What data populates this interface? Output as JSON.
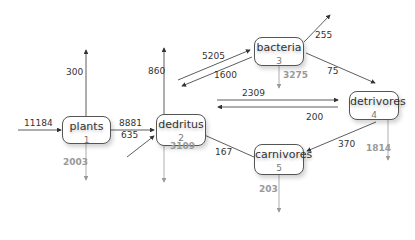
{
  "colors": {
    "flow_arrow": "#333333",
    "loss_arrow": "#999999",
    "node_border": "#555555"
  },
  "nodes": [
    {
      "id": "plants",
      "name": "plants",
      "number": "1"
    },
    {
      "id": "dedritus",
      "name": "dedritus",
      "number": "2"
    },
    {
      "id": "bacteria",
      "name": "bacteria",
      "number": "3"
    },
    {
      "id": "detrivores",
      "name": "detrivores",
      "number": "4"
    },
    {
      "id": "carnivores",
      "name": "carnivores",
      "number": "5"
    }
  ],
  "flows": {
    "input_plants": "11184",
    "plants_export": "300",
    "plants_loss": "2003",
    "plants_to_dedritus": "8881",
    "input_dedritus": "635",
    "dedritus_export": "860",
    "dedritus_loss": "3109",
    "dedritus_to_bacteria": "5205",
    "bacteria_to_dedritus": "1600",
    "bacteria_export": "255",
    "bacteria_loss": "3275",
    "bacteria_to_detrivores": "75",
    "dedritus_to_detrivores": "2309",
    "detrivores_to_dedritus": "200",
    "detrivores_loss": "1814",
    "detrivores_to_carnivores": "370",
    "carnivores_to_dedritus": "167",
    "carnivores_loss": "203"
  }
}
